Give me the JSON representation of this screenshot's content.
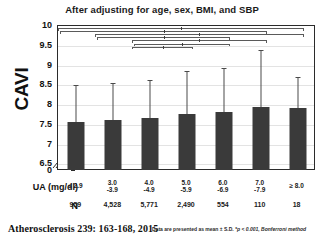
{
  "chart_data": {
    "type": "bar",
    "title": "After adjusting for age, sex, BMI, and SBP",
    "xlabel": "UA (mg/dl)",
    "ylabel": "CAVI",
    "ylim": [
      6.5,
      10
    ],
    "y_break_at_zero": true,
    "grid": true,
    "legend_position": "none",
    "categories": [
      "≤ 2.9",
      "3.0\n-3.9",
      "4.0\n-4.9",
      "5.0\n-5.9",
      "6.0\n-6.9",
      "7.0\n-7.9",
      "≥ 8.0"
    ],
    "category_lines": [
      {
        "line1": "≤ 2.9",
        "line2": ""
      },
      {
        "line1": "3.0",
        "line2": "-3.9"
      },
      {
        "line1": "4.0",
        "line2": "-4.9"
      },
      {
        "line1": "5.0",
        "line2": "-5.9"
      },
      {
        "line1": "6.0",
        "line2": "-6.9"
      },
      {
        "line1": "7.0",
        "line2": "-7.9"
      },
      {
        "line1": "≥ 8.0",
        "line2": ""
      }
    ],
    "values": [
      7.57,
      7.63,
      7.67,
      7.78,
      7.83,
      7.96,
      7.92
    ],
    "errors_upper": [
      8.5,
      8.55,
      8.63,
      8.87,
      8.93,
      9.4,
      8.7
    ],
    "n_label": "N",
    "n_values": [
      "959",
      "4,528",
      "5,771",
      "2,490",
      "554",
      "110",
      "18"
    ],
    "y_ticks": [
      "10",
      "9.5",
      "9",
      "8.5",
      "8",
      "7.5",
      "7",
      "6.5",
      "0"
    ],
    "y_tick_values": [
      10,
      9.5,
      9,
      8.5,
      8,
      7.5,
      7,
      6.5,
      0
    ],
    "annotations": [
      "Data are presented as mean ± S.D.",
      "*p < 0.001, Bonferroni method"
    ],
    "significance_brackets": [
      {
        "from": 0,
        "to": 6,
        "level": 1
      },
      {
        "from": 0,
        "to": 5,
        "level": 2
      },
      {
        "from": 1,
        "to": 6,
        "level": 3
      },
      {
        "from": 1,
        "to": 4,
        "level": 4
      },
      {
        "from": 2,
        "to": 5,
        "level": 5
      },
      {
        "from": 2,
        "to": 4,
        "level": 6
      },
      {
        "from": 2,
        "to": 3,
        "level": 7
      }
    ],
    "bar_color": "#3a3a3a",
    "error_color": "#4a4a4a",
    "axis_color": "#2b2b2b",
    "grid_color": "#e3e3e3",
    "background": "#ffffff"
  },
  "footer": {
    "citation": "Atherosclerosis 239: 163-168, 2015",
    "note_plain": "Data are presented as mean ± S.D. ",
    "note_italic": "*p < 0.001, Bonferroni method"
  },
  "axis": {
    "x_row_label": "UA (mg/dl)",
    "n_row_label": "N",
    "y_title": "CAVI"
  }
}
